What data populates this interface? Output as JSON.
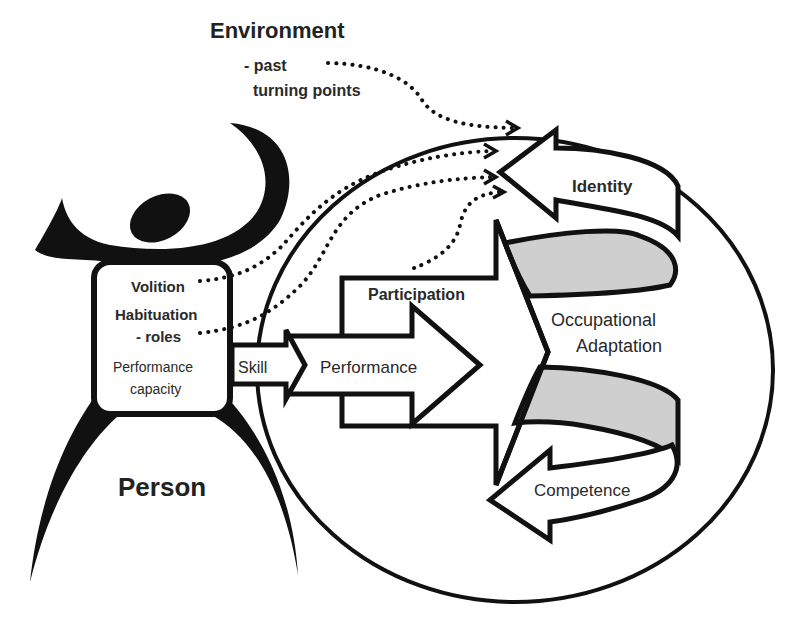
{
  "diagram": {
    "title": "Environment",
    "environment_sub": [
      "- past",
      "turning points"
    ],
    "person": {
      "label": "Person",
      "box_items": {
        "volition": "Volition",
        "habituation": "Habituation",
        "roles": "- roles",
        "performance_capacity_line1": "Performance",
        "performance_capacity_line2": "capacity"
      }
    },
    "flow": {
      "skill": "Skill",
      "performance": "Performance",
      "participation": "Participation"
    },
    "outcome": {
      "occupational_line1": "Occupational",
      "occupational_line2": "Adaptation",
      "identity": "Identity",
      "competence": "Competence"
    },
    "colors": {
      "stroke": "#111111",
      "ribbon_fill": "#cfcfcf",
      "background": "#ffffff",
      "text": "#2a2a2a"
    }
  }
}
